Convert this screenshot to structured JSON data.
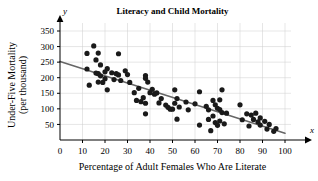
{
  "chart_data": {
    "type": "scatter",
    "title": "Literacy and Child Mortality",
    "xlabel": "Percentage of Adult Females Who Are Literate",
    "ylabel": "Under-Five Mortality (per thousand)",
    "ylabel_line1": "Under-Five Mortality",
    "ylabel_line2": "(per thousand)",
    "x_axis_letter": "x",
    "y_axis_letter": "y",
    "xlim": [
      0,
      100
    ],
    "ylim": [
      0,
      365
    ],
    "xticks": [
      0,
      10,
      20,
      30,
      40,
      50,
      60,
      70,
      80,
      90,
      100
    ],
    "xtick_labels": [
      "0",
      "10",
      "20",
      "30",
      "40",
      "50",
      "60",
      "70",
      "80",
      "90",
      "100"
    ],
    "yticks": [
      50,
      100,
      150,
      200,
      250,
      300,
      350
    ],
    "ytick_labels": [
      "50",
      "100",
      "150",
      "200",
      "250",
      "300",
      "350"
    ],
    "grid": true,
    "grid_color": "#cccccc",
    "legend": null,
    "marker_color": "#1a1a1a",
    "marker_size": 2.6,
    "trendline": {
      "type": "line",
      "color": "#666666",
      "width": 1.6,
      "x_start": 0,
      "y_start": 252,
      "x_end": 100,
      "y_end": 22
    },
    "points": [
      [
        12,
        278
      ],
      [
        12,
        228
      ],
      [
        13,
        176
      ],
      [
        15,
        302
      ],
      [
        16,
        257
      ],
      [
        16,
        215
      ],
      [
        17,
        279
      ],
      [
        17,
        213
      ],
      [
        17,
        186
      ],
      [
        18,
        241
      ],
      [
        18,
        206
      ],
      [
        19,
        185
      ],
      [
        20,
        219
      ],
      [
        20,
        197
      ],
      [
        21,
        229
      ],
      [
        21,
        161
      ],
      [
        23,
        216
      ],
      [
        24,
        194
      ],
      [
        25,
        213
      ],
      [
        26,
        277
      ],
      [
        26,
        209
      ],
      [
        27,
        191
      ],
      [
        29,
        222
      ],
      [
        30,
        210
      ],
      [
        31,
        185
      ],
      [
        33,
        152
      ],
      [
        34,
        127
      ],
      [
        35,
        166
      ],
      [
        36,
        123
      ],
      [
        37,
        136
      ],
      [
        38,
        207
      ],
      [
        38,
        198
      ],
      [
        38,
        118
      ],
      [
        38,
        84
      ],
      [
        39,
        186
      ],
      [
        40,
        152
      ],
      [
        41,
        163
      ],
      [
        42,
        147
      ],
      [
        43,
        151
      ],
      [
        44,
        119
      ],
      [
        45,
        133
      ],
      [
        47,
        112
      ],
      [
        48,
        105
      ],
      [
        49,
        99
      ],
      [
        50,
        99
      ],
      [
        51,
        161
      ],
      [
        51,
        118
      ],
      [
        52,
        133
      ],
      [
        52,
        67
      ],
      [
        53,
        106
      ],
      [
        56,
        122
      ],
      [
        57,
        97
      ],
      [
        60,
        116
      ],
      [
        62,
        155
      ],
      [
        62,
        48
      ],
      [
        65,
        108
      ],
      [
        66,
        97
      ],
      [
        66,
        66
      ],
      [
        67,
        30
      ],
      [
        68,
        127
      ],
      [
        68,
        77
      ],
      [
        69,
        113
      ],
      [
        69,
        56
      ],
      [
        70,
        102
      ],
      [
        70,
        47
      ],
      [
        71,
        129
      ],
      [
        71,
        98
      ],
      [
        71,
        61
      ],
      [
        72,
        161
      ],
      [
        72,
        88
      ],
      [
        73,
        52
      ],
      [
        74,
        86
      ],
      [
        80,
        113
      ],
      [
        81,
        65
      ],
      [
        83,
        84
      ],
      [
        84,
        45
      ],
      [
        85,
        80
      ],
      [
        86,
        66
      ],
      [
        87,
        86
      ],
      [
        88,
        58
      ],
      [
        89,
        71
      ],
      [
        89,
        48
      ],
      [
        91,
        60
      ],
      [
        92,
        35
      ],
      [
        93,
        50
      ],
      [
        95,
        28
      ],
      [
        96,
        37
      ]
    ]
  }
}
